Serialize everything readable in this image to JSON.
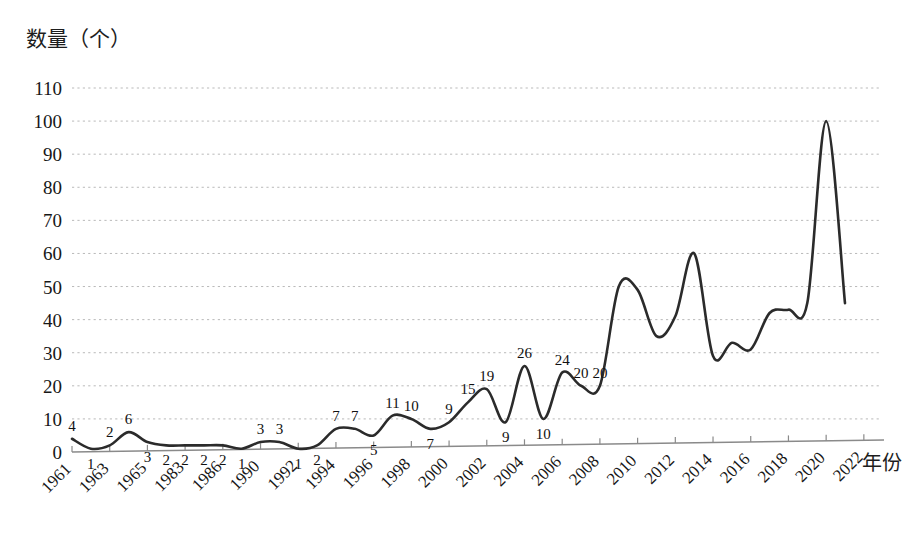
{
  "chart_data": {
    "type": "line",
    "title": "",
    "ylabel": "数量（个）",
    "xlabel": "年份",
    "ylim": [
      0,
      110
    ],
    "ytick_values": [
      0,
      10,
      20,
      30,
      40,
      50,
      60,
      70,
      80,
      90,
      100,
      110
    ],
    "ytick_labels": [
      "0",
      "10",
      "20",
      "30",
      "40",
      "50",
      "60",
      "70",
      "80",
      "90",
      "100",
      "110"
    ],
    "grid": true,
    "legend": "none",
    "smooth": true,
    "line_color": "#2b2b2b",
    "grid_color": "#b9b9b9",
    "axis_color": "#8a8a8a",
    "x_tick_labels": [
      "1961",
      "1963",
      "1965",
      "1983",
      "1986",
      "1990",
      "1992",
      "1994",
      "1996",
      "1998",
      "2000",
      "2002",
      "2004",
      "2006",
      "2008",
      "2010",
      "2012",
      "2014",
      "2016",
      "2018",
      "2020",
      "2022"
    ],
    "x": [
      "1961",
      "1962",
      "1963",
      "1964",
      "1965",
      "1983",
      "1984",
      "1986",
      "1987",
      "1990",
      "1991",
      "1992",
      "1993",
      "1994",
      "1995",
      "1996",
      "1997",
      "1998",
      "1999",
      "2000",
      "2001",
      "2002",
      "2003",
      "2004",
      "2005",
      "2006",
      "2007",
      "2008",
      "2009",
      "2010",
      "2011",
      "2012",
      "2013",
      "2014",
      "2015",
      "2016",
      "2017",
      "2018",
      "2019",
      "2020",
      "2021",
      "2022"
    ],
    "values": [
      4,
      1,
      2,
      6,
      3,
      2,
      2,
      2,
      2,
      1,
      3,
      3,
      1,
      2,
      7,
      7,
      5,
      11,
      10,
      7,
      9,
      15,
      19,
      9,
      26,
      10,
      24,
      20,
      20,
      50,
      49,
      35,
      41,
      60,
      29,
      33,
      31,
      42,
      43,
      45,
      100,
      45
    ],
    "labeled_points": [
      {
        "x": "1961",
        "value": 4,
        "label": "4"
      },
      {
        "x": "1962",
        "value": 1,
        "label": "1"
      },
      {
        "x": "1963",
        "value": 2,
        "label": "2"
      },
      {
        "x": "1964",
        "value": 6,
        "label": "6"
      },
      {
        "x": "1965",
        "value": 3,
        "label": "3"
      },
      {
        "x": "1983",
        "value": 2,
        "label": "2"
      },
      {
        "x": "1984",
        "value": 2,
        "label": "2"
      },
      {
        "x": "1986",
        "value": 2,
        "label": "2"
      },
      {
        "x": "1987",
        "value": 2,
        "label": "2"
      },
      {
        "x": "1990",
        "value": 1,
        "label": "1"
      },
      {
        "x": "1991",
        "value": 3,
        "label": "3"
      },
      {
        "x": "1992",
        "value": 3,
        "label": "3"
      },
      {
        "x": "1993",
        "value": 1,
        "label": "1"
      },
      {
        "x": "1994",
        "value": 2,
        "label": "2"
      },
      {
        "x": "1995",
        "value": 7,
        "label": "7"
      },
      {
        "x": "1996",
        "value": 7,
        "label": "7"
      },
      {
        "x": "1997",
        "value": 5,
        "label": "5"
      },
      {
        "x": "1998",
        "value": 11,
        "label": "11"
      },
      {
        "x": "1999",
        "value": 10,
        "label": "10"
      },
      {
        "x": "2000",
        "value": 7,
        "label": "7"
      },
      {
        "x": "2001",
        "value": 9,
        "label": "9"
      },
      {
        "x": "2002",
        "value": 15,
        "label": "15"
      },
      {
        "x": "2003",
        "value": 19,
        "label": "19"
      },
      {
        "x": "2004",
        "value": 9,
        "label": "9"
      },
      {
        "x": "2005",
        "value": 26,
        "label": "26"
      },
      {
        "x": "2006",
        "value": 10,
        "label": "10"
      },
      {
        "x": "2007",
        "value": 24,
        "label": "24"
      },
      {
        "x": "2008",
        "value": 20,
        "label": "20"
      },
      {
        "x": "2009",
        "value": 20,
        "label": "20"
      }
    ]
  }
}
